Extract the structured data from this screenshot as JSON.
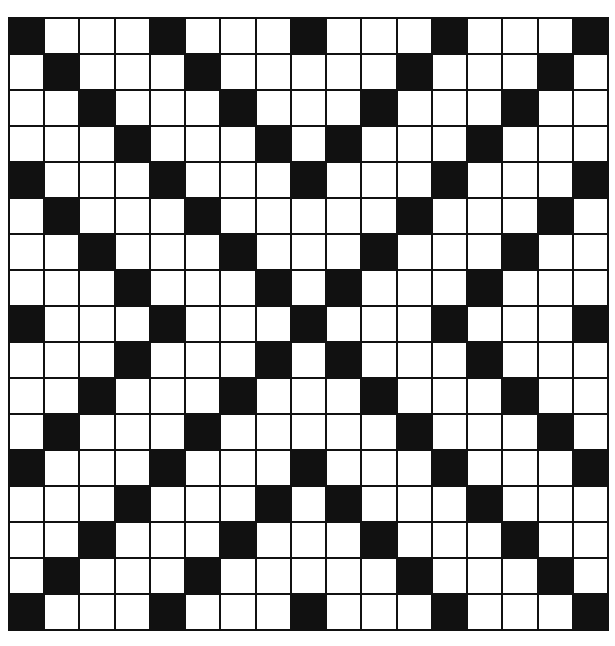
{
  "puzzle": {
    "type": "crossword-grid",
    "rows": 17,
    "cols": 17,
    "colors": {
      "black": "#111111",
      "white": "#ffffff",
      "line": "#111111"
    },
    "black_cells_by_row": [
      [
        0,
        4,
        8,
        12,
        16
      ],
      [
        1,
        5,
        11,
        15
      ],
      [
        2,
        6,
        10,
        14
      ],
      [
        3,
        7,
        9,
        13
      ],
      [
        0,
        4,
        8,
        12,
        16
      ],
      [
        1,
        5,
        11,
        15
      ],
      [
        2,
        6,
        10,
        14
      ],
      [
        3,
        7,
        9,
        13
      ],
      [
        0,
        4,
        8,
        12,
        16
      ],
      [
        3,
        7,
        9,
        13
      ],
      [
        2,
        6,
        10,
        14
      ],
      [
        1,
        5,
        11,
        15
      ],
      [
        0,
        4,
        8,
        12,
        16
      ],
      [
        3,
        7,
        9,
        13
      ],
      [
        2,
        6,
        10,
        14
      ],
      [
        1,
        5,
        11,
        15
      ],
      [
        0,
        4,
        8,
        12,
        16
      ]
    ]
  }
}
